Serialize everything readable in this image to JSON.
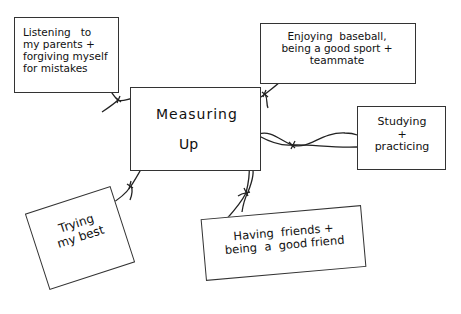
{
  "diagram": {
    "type": "concept-map",
    "center": {
      "label_line1": "Measuring",
      "label_line2": "Up"
    },
    "nodes": [
      {
        "id": "listen",
        "text": "Listening   to\nmy parents +\nforgiving myself\nfor mistakes"
      },
      {
        "id": "baseball",
        "text": "Enjoying  baseball,\nbeing a good sport +\nteammate"
      },
      {
        "id": "study",
        "text": "Studying\n+\npracticing"
      },
      {
        "id": "try",
        "text": "Trying\nmy best"
      },
      {
        "id": "friend",
        "text": "Having  friends +\nbeing  a  good friend"
      }
    ],
    "connections": [
      {
        "from": "center",
        "to": "listen",
        "style": "string-tie"
      },
      {
        "from": "center",
        "to": "baseball",
        "style": "string-tie"
      },
      {
        "from": "center",
        "to": "study",
        "style": "string-tie"
      },
      {
        "from": "center",
        "to": "try",
        "style": "string-tie"
      },
      {
        "from": "center",
        "to": "friend",
        "style": "string-tie"
      }
    ],
    "colors": {
      "stroke": "#333333",
      "background": "#ffffff",
      "text": "#111111"
    }
  }
}
